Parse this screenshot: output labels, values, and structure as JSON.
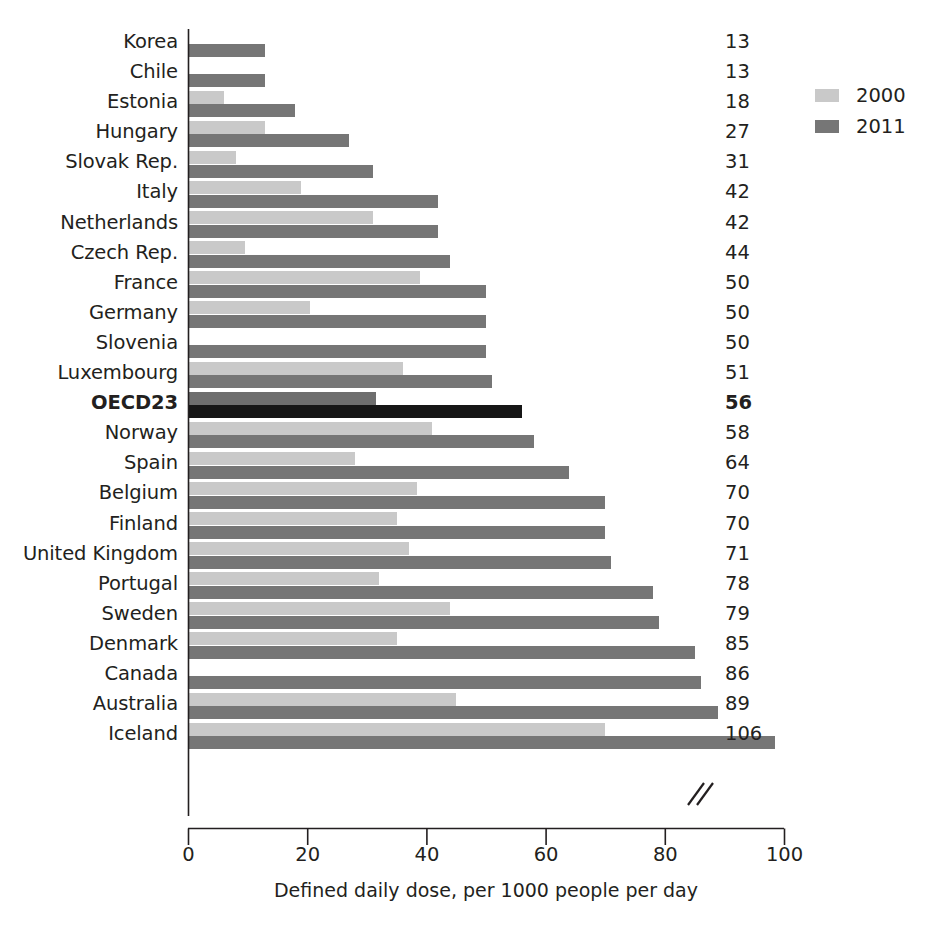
{
  "chart_data": {
    "type": "bar",
    "orientation": "horizontal",
    "title": "",
    "subtitle": "",
    "xlabel": "Defined daily dose, per 1000 people per day",
    "ylabel": "",
    "xlim": [
      0,
      100
    ],
    "xticks": [
      0,
      20,
      40,
      60,
      80,
      100
    ],
    "xtick_labels": [
      "0",
      "20",
      "40",
      "60",
      "80",
      "100"
    ],
    "grid": false,
    "legend_position": "top-right",
    "axis_break_note": "Iceland 2011 bar is truncated with a double-slash axis break; actual value 106",
    "categories": [
      "Korea",
      "Chile",
      "Estonia",
      "Hungary",
      "Slovak Rep.",
      "Italy",
      "Netherlands",
      "Czech Rep.",
      "France",
      "Germany",
      "Slovenia",
      "Luxembourg",
      "OECD23",
      "Norway",
      "Spain",
      "Belgium",
      "Finland",
      "United Kingdom",
      "Portugal",
      "Sweden",
      "Denmark",
      "Canada",
      "Australia",
      "Iceland"
    ],
    "series": [
      {
        "name": "2000",
        "color": "#c9c9c9",
        "values": [
          null,
          null,
          6,
          13,
          8,
          19,
          31,
          9.5,
          39,
          20.5,
          null,
          36,
          31.5,
          41,
          28,
          38.5,
          35,
          37,
          32,
          44,
          35,
          null,
          45,
          70
        ]
      },
      {
        "name": "2011",
        "color": "#767676",
        "values": [
          13,
          13,
          18,
          27,
          31,
          42,
          42,
          44,
          50,
          50,
          50,
          51,
          56,
          58,
          64,
          70,
          70,
          71,
          78,
          79,
          85,
          86,
          89,
          106
        ]
      }
    ],
    "value_labels": [
      "13",
      "13",
      "18",
      "27",
      "31",
      "42",
      "42",
      "44",
      "50",
      "50",
      "50",
      "51",
      "56",
      "58",
      "64",
      "70",
      "70",
      "71",
      "78",
      "79",
      "85",
      "86",
      "89",
      "106"
    ],
    "highlight_category": "OECD23",
    "highlight_colors": {
      "2000": "#6e6e6e",
      "2011": "#161616"
    }
  },
  "legend": {
    "items": [
      {
        "label": "2000",
        "color": "#c9c9c9",
        "swatch": "legend-swatch-2000"
      },
      {
        "label": "2011",
        "color": "#767676",
        "swatch": "legend-swatch-2011"
      }
    ]
  },
  "axis": {
    "x_title": "Defined daily dose, per 1000 people per day",
    "ticks": [
      "0",
      "20",
      "40",
      "60",
      "80",
      "100"
    ]
  }
}
